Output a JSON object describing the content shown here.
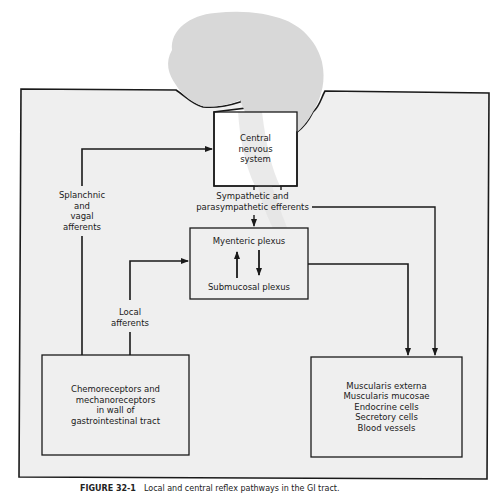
{
  "diagram": {
    "colors": {
      "panel_fill": "#efefef",
      "brain_fill": "#d8d8d8",
      "line": "#1a1a1a",
      "page": "#ffffff"
    },
    "nodes": {
      "cns": {
        "label": "Central\nnervous\nsystem"
      },
      "plexus": {
        "top_label": "Myenteric plexus",
        "bottom_label": "Submucosal plexus"
      },
      "receptors": {
        "label": "Chemoreceptors and\nmechanoreceptors\nin wall of\ngastrointestinal tract"
      },
      "effectors": {
        "label": "Muscularis externa\nMuscularis mucosae\nEndocrine cells\nSecretory cells\nBlood vessels"
      }
    },
    "edge_labels": {
      "splanchnic": "Splanchnic\nand\nvagal\nafferents",
      "efferents": "Sympathetic and\nparasympathetic efferents",
      "local": "Local\nafferents"
    },
    "edges": [
      {
        "from": "receptors",
        "to": "cns",
        "label": "Splanchnic and vagal afferents"
      },
      {
        "from": "receptors",
        "to": "plexus",
        "label": "Local afferents"
      },
      {
        "from": "cns",
        "to": "plexus",
        "label": "Sympathetic and parasympathetic efferents"
      },
      {
        "from": "cns",
        "to": "effectors",
        "label": "Sympathetic and parasympathetic efferents"
      },
      {
        "from": "plexus",
        "to": "effectors",
        "label": ""
      },
      {
        "from": "plexus.submucosal",
        "to": "plexus.myenteric",
        "label": ""
      },
      {
        "from": "plexus.myenteric",
        "to": "plexus.submucosal",
        "label": ""
      }
    ]
  },
  "caption": {
    "figure_number": "FIGURE 32-1",
    "text": "Local and central reflex pathways in the GI tract."
  }
}
